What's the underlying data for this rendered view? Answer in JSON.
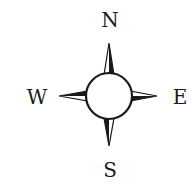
{
  "compass": {
    "labels": {
      "north": "N",
      "south": "S",
      "east": "E",
      "west": "W"
    },
    "colors": {
      "ink": "#1a1a1a",
      "background": "#ffffff"
    }
  }
}
